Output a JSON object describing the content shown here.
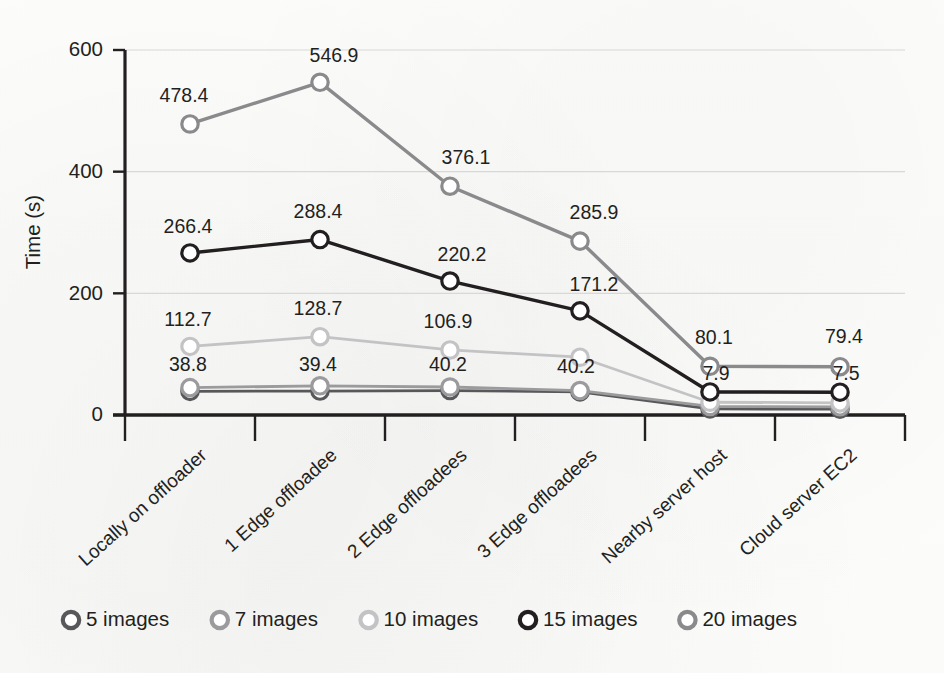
{
  "chart_data": {
    "type": "line",
    "title": "",
    "xlabel": "",
    "ylabel": "Time (s)",
    "ylim": [
      0,
      600
    ],
    "yticks": [
      0,
      200,
      400,
      600
    ],
    "ytick_labels": [
      "0",
      "200",
      "400",
      "600"
    ],
    "grid": "horizontal",
    "legend_position": "bottom",
    "categories": [
      "Locally on offloader",
      "1 Edge offloadee",
      "2 Edge offloadees",
      "3 Edge offloadees",
      "Nearby server host",
      "Cloud server EC2"
    ],
    "series": [
      {
        "name": "5 images",
        "color": "#58585a",
        "values": [
          38.8,
          39.4,
          40.2,
          38.0,
          10.0,
          9.6
        ],
        "labels": [
          "38.8",
          "39.4",
          "40.2",
          "",
          "",
          ""
        ]
      },
      {
        "name": "7 images",
        "color": "#9b9b9d",
        "values": [
          45.0,
          48.0,
          46.0,
          40.2,
          14.0,
          13.5
        ],
        "labels": [
          "",
          "",
          "",
          "40.2",
          "",
          ""
        ]
      },
      {
        "name": "10 images",
        "color": "#c3c3c5",
        "values": [
          112.7,
          128.7,
          106.9,
          95.0,
          21.0,
          20.0
        ],
        "labels": [
          "112.7",
          "128.7",
          "106.9",
          "",
          "",
          ""
        ]
      },
      {
        "name": "15 images",
        "color": "#231f20",
        "values": [
          266.4,
          288.4,
          220.2,
          171.2,
          37.9,
          37.5
        ],
        "labels": [
          "266.4",
          "288.4",
          "220.2",
          "171.2",
          "7.9",
          "7.5"
        ]
      },
      {
        "name": "20 images",
        "color": "#8a8a8c",
        "values": [
          478.4,
          546.9,
          376.1,
          285.9,
          80.1,
          79.4
        ],
        "labels": [
          "478.4",
          "546.9",
          "376.1",
          "285.9",
          "80.1",
          "79.4"
        ]
      }
    ],
    "label_offsets": [
      [
        [
          -2,
          -20
        ],
        [
          -2,
          -20
        ],
        [
          -2,
          -20
        ],
        [
          0,
          0
        ],
        [
          0,
          0
        ],
        [
          0,
          0
        ]
      ],
      [
        [
          0,
          0
        ],
        [
          0,
          0
        ],
        [
          0,
          0
        ],
        [
          -4,
          -18
        ],
        [
          0,
          0
        ],
        [
          0,
          0
        ]
      ],
      [
        [
          -2,
          -20
        ],
        [
          -2,
          -22
        ],
        [
          -2,
          -22
        ],
        [
          0,
          0
        ],
        [
          0,
          0
        ],
        [
          0,
          0
        ]
      ],
      [
        [
          -2,
          -20
        ],
        [
          -2,
          -22
        ],
        [
          12,
          -20
        ],
        [
          14,
          -20
        ],
        [
          6,
          -12
        ],
        [
          6,
          -12
        ]
      ],
      [
        [
          -6,
          -22
        ],
        [
          14,
          -20
        ],
        [
          16,
          -22
        ],
        [
          14,
          -22
        ],
        [
          4,
          -22
        ],
        [
          4,
          -24
        ]
      ]
    ]
  },
  "legend": {
    "marker_icon": "circle-outline-icon",
    "items": [
      {
        "label": "5 images",
        "color": "#58585a"
      },
      {
        "label": "7 images",
        "color": "#9b9b9d"
      },
      {
        "label": "10 images",
        "color": "#c3c3c5"
      },
      {
        "label": "15 images",
        "color": "#231f20"
      },
      {
        "label": "20 images",
        "color": "#8a8a8c"
      }
    ]
  }
}
